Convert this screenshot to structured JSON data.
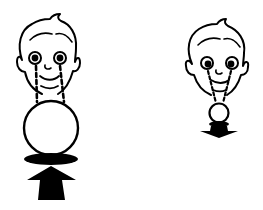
{
  "figure": {
    "colors": {
      "ink": "#000000",
      "background": "#ffffff"
    },
    "panels": [
      {
        "id": "left",
        "ball_size": "large",
        "arrow_direction": "up"
      },
      {
        "id": "right",
        "ball_size": "small",
        "arrow_direction": "down"
      }
    ]
  }
}
